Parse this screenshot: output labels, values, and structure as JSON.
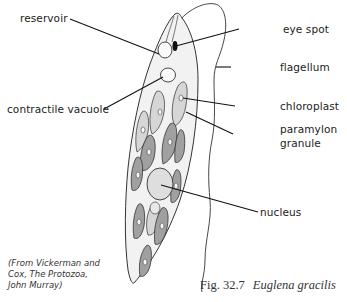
{
  "figure": {
    "caption_number": "Fig. 32.7",
    "caption_species": "Euglena gracilis",
    "credit_lines": [
      "(From Vickerman and",
      "Cox, The Protozoa,",
      "John Murray)"
    ]
  },
  "labels": {
    "reservoir": "reservoir",
    "eye_spot": "eye spot",
    "flagellum": "flagellum",
    "contractile_vacuole": "contractile vacuole",
    "chloroplast": "chloroplast",
    "paramylon_granule_line1": "paramylon",
    "paramylon_granule_line2": "granule",
    "nucleus": "nucleus"
  },
  "colors": {
    "line": "#222222",
    "cytoplasm": "#f0f0f0",
    "chloroplast_light": "#d4d4d4",
    "chloroplast_dark": "#9a9a9a",
    "nucleus": "#dcdcdc"
  }
}
